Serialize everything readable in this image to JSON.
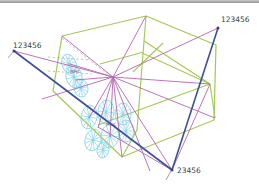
{
  "window": {
    "top_border": {
      "color_top": "#c9c9c9",
      "color_bottom": "#969696"
    }
  },
  "viewport": {
    "background": "#ffffff"
  },
  "figure": {
    "colors": {
      "wireframe_green": "#a4ca56",
      "rigid_magenta": "#b868b4",
      "constraint_blue": "#3c4f9e",
      "spring_cyan": "#85d2ec",
      "dashed_gray": "#ababab",
      "tick_gray": "#9a9aa2",
      "label_dark": "#3d3f48",
      "small_label_gray": "#63636d",
      "node_dark": "#35406e"
    },
    "wireframe": {
      "hexagon": [
        [
          62,
          36
        ],
        [
          146,
          16
        ],
        [
          216,
          45
        ],
        [
          214,
          120
        ],
        [
          122,
          157
        ],
        [
          53,
          91
        ]
      ],
      "inner_segments": [
        [
          [
            146,
            16
          ],
          [
            137,
            130
          ],
          [
            122,
            157
          ]
        ],
        [
          [
            144,
            41
          ],
          [
            210,
            84
          ]
        ],
        [
          [
            140,
            52
          ],
          [
            210,
            84
          ]
        ],
        [
          [
            210,
            84
          ],
          [
            215,
            118
          ]
        ],
        [
          [
            210,
            84
          ],
          [
            98,
            125
          ]
        ],
        [
          [
            163,
            43
          ],
          [
            133,
            72
          ]
        ],
        [
          [
            100,
            64
          ],
          [
            140,
            53
          ]
        ]
      ]
    },
    "spider": {
      "hub": [
        113,
        77
      ],
      "endpoints": [
        [
          14,
          51
        ],
        [
          62,
          36
        ],
        [
          146,
          16
        ],
        [
          218,
          28
        ],
        [
          210,
          84
        ],
        [
          215,
          118
        ],
        [
          172,
          170
        ],
        [
          150,
          171
        ],
        [
          122,
          157
        ],
        [
          110,
          137
        ],
        [
          98,
          128
        ],
        [
          89,
          118
        ],
        [
          75,
          80
        ],
        [
          70,
          64
        ],
        [
          42,
          99
        ]
      ],
      "extra_segments": [
        [
          [
            98,
            127
          ],
          [
            172,
            170
          ]
        ],
        [
          [
            172,
            170
          ],
          [
            210,
            84
          ]
        ]
      ]
    },
    "constraints": {
      "lines": [
        [
          [
            14,
            51
          ],
          [
            172,
            170
          ]
        ],
        [
          [
            218,
            28
          ],
          [
            172,
            170
          ]
        ]
      ],
      "nodes": [
        [
          14,
          51
        ],
        [
          218,
          28
        ],
        [
          172,
          170
        ]
      ],
      "labels": [
        {
          "text": "123456",
          "x": 13,
          "y": 48
        },
        {
          "text": "123456",
          "x": 221,
          "y": 22
        },
        {
          "text": "23456",
          "x": 177,
          "y": 173
        }
      ]
    },
    "dashed_segments": [
      [
        [
          62,
          38
        ],
        [
          110,
          76
        ]
      ],
      [
        [
          48,
          57
        ],
        [
          90,
          60
        ]
      ],
      [
        [
          48,
          71
        ],
        [
          92,
          74
        ]
      ]
    ],
    "ticks": [
      [
        [
          14,
          51
        ],
        [
          8,
          58
        ]
      ],
      [
        [
          171,
          171
        ],
        [
          166,
          180
        ]
      ]
    ],
    "spring_clusters": [
      {
        "label": {
          "text": "MHC",
          "x": 70,
          "y": 73
        },
        "wheels": [
          {
            "cx": 69,
            "cy": 64,
            "rx": 7,
            "ry": 10,
            "rot": -20
          },
          {
            "cx": 74,
            "cy": 77,
            "rx": 8,
            "ry": 11,
            "rot": -15
          },
          {
            "cx": 81,
            "cy": 88,
            "rx": 7,
            "ry": 9,
            "rot": -10
          }
        ]
      },
      {
        "label": {
          "text": "MHC",
          "x": 106,
          "y": 126
        },
        "wheels": [
          {
            "cx": 89,
            "cy": 117,
            "rx": 8,
            "ry": 12,
            "rot": 10
          },
          {
            "cx": 106,
            "cy": 112,
            "rx": 8,
            "ry": 12,
            "rot": 5
          },
          {
            "cx": 123,
            "cy": 114,
            "rx": 8,
            "ry": 11,
            "rot": 0
          },
          {
            "cx": 93,
            "cy": 140,
            "rx": 8,
            "ry": 11,
            "rot": 15
          },
          {
            "cx": 110,
            "cy": 136,
            "rx": 9,
            "ry": 12,
            "rot": 5
          },
          {
            "cx": 126,
            "cy": 131,
            "rx": 8,
            "ry": 11,
            "rot": 0
          },
          {
            "cx": 103,
            "cy": 150,
            "rx": 6,
            "ry": 8,
            "rot": 10
          }
        ]
      }
    ]
  }
}
